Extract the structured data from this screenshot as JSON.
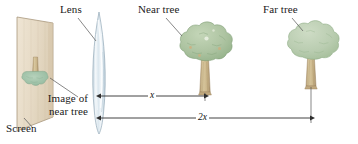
{
  "figure": {
    "type": "optics-ray-diagram",
    "caption_labels": {
      "lens": "Lens",
      "near_tree": "Near tree",
      "far_tree": "Far tree",
      "image_of_near_tree": "Image of near tree",
      "screen": "Screen"
    },
    "dimensions": [
      {
        "id": "x",
        "label": "x",
        "from": "lens",
        "to": "near tree"
      },
      {
        "id": "2x",
        "label": "2x",
        "from": "lens",
        "to": "far tree"
      }
    ],
    "colors": {
      "screen_fill": "#e4d7c2",
      "screen_edge": "#b09d80",
      "lens_fill": "#dfe8ee",
      "lens_edge": "#9fb3c0",
      "near_canopy": "#adc3a2",
      "near_canopy_shadow": "#8fae86",
      "far_canopy": "#b9cdb0",
      "far_canopy_shadow": "#9dba93",
      "trunk": "#c8b48a",
      "trunk_shadow": "#a89166",
      "image_canopy": "#9dbfa6",
      "line": "#3b3b3b",
      "leader": "#555555",
      "text": "#1a1a1a",
      "background": "#ffffff"
    },
    "geometry": {
      "screen_quad": [
        [
          17,
          17
        ],
        [
          53,
          23
        ],
        [
          53,
          117
        ],
        [
          17,
          131
        ]
      ],
      "lens_center_x": 99,
      "lens_top_y": 12,
      "lens_bottom_y": 134,
      "near_tree_trunk_x": 205,
      "far_tree_trunk_x": 311,
      "dim_x_line_y": 96,
      "dim_2x_line_y": 118
    }
  }
}
